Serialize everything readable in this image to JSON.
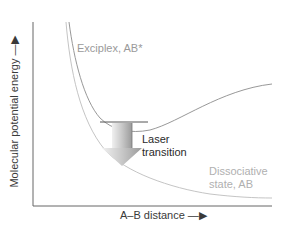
{
  "diagram": {
    "axes": {
      "y_label": "Molecular potential energy —▶",
      "x_label": "A–B distance —▶"
    },
    "curves": [
      {
        "name": "Exciplex, AB*",
        "type": "bound",
        "color": "#9a9a9a"
      },
      {
        "name": "Dissociative state, AB",
        "type": "repulsive",
        "color": "#b8b8b8"
      }
    ],
    "labels": {
      "exciplex": "Exciplex, AB*",
      "dissociative_line1": "Dissociative",
      "dissociative_line2": "state, AB",
      "laser_line1": "Laser",
      "laser_line2": "transition"
    },
    "colors": {
      "axis": "#555555",
      "curve": "#999999",
      "arrow_light": "#e6e6e6",
      "arrow_dark": "#9e9e9e",
      "text_gray": "#9a9a9a",
      "text_dark": "#2a2a2a"
    }
  }
}
